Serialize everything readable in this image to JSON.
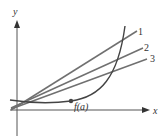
{
  "diagram": {
    "axes": {
      "x_label": "x",
      "y_label": "y"
    },
    "curve": {
      "label": "f(a)"
    },
    "lines": [
      {
        "id": 1,
        "label": "1"
      },
      {
        "id": 2,
        "label": "2"
      },
      {
        "id": 3,
        "label": "3"
      }
    ],
    "colors": {
      "axis": "#555555",
      "curve": "#444444",
      "lines": "#707070",
      "point": "#444444"
    }
  }
}
